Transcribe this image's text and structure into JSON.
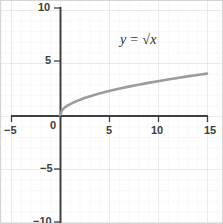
{
  "chart_data": {
    "type": "line",
    "title": "",
    "annotation": "y = √x",
    "function": "y = sqrt(x)",
    "xlabel": "",
    "ylabel": "",
    "xlim": [
      -5,
      15
    ],
    "ylim": [
      -10,
      10
    ],
    "x_ticks": [
      -5,
      0,
      5,
      10,
      15
    ],
    "x_tick_labels": [
      "−5",
      "0",
      "5",
      "10",
      "15"
    ],
    "y_ticks": [
      -10,
      -5,
      5,
      10
    ],
    "y_tick_labels": [
      "−10",
      "−5",
      "5",
      "10"
    ],
    "grid": true,
    "grid_minor_step": 1,
    "grid_major_step": 5,
    "legend": "none",
    "series": [
      {
        "name": "y = √x",
        "color": "#9c9c9c",
        "x": [
          0,
          0.25,
          0.5,
          0.75,
          1,
          1.5,
          2,
          2.5,
          3,
          3.5,
          4,
          5,
          6,
          7,
          8,
          9,
          10,
          11,
          12,
          13,
          14,
          15
        ],
        "y": [
          0,
          0.5,
          0.71,
          0.87,
          1,
          1.22,
          1.41,
          1.58,
          1.73,
          1.87,
          2,
          2.24,
          2.45,
          2.65,
          2.83,
          3,
          3.16,
          3.32,
          3.46,
          3.61,
          3.74,
          3.87
        ]
      }
    ]
  },
  "axes": {
    "x_labels": [
      {
        "text": "−5",
        "value": -5
      },
      {
        "text": "0",
        "value": 0
      },
      {
        "text": "5",
        "value": 5
      },
      {
        "text": "10",
        "value": 10
      },
      {
        "text": "15",
        "value": 15
      }
    ],
    "y_labels": [
      {
        "text": "10",
        "value": 10
      },
      {
        "text": "5",
        "value": 5
      },
      {
        "text": "−5",
        "value": -5
      },
      {
        "text": "−10",
        "value": -10
      }
    ]
  },
  "annotation": {
    "lhs": "y",
    "operator": "=",
    "radical": "√",
    "variable": "x"
  },
  "colors": {
    "curve": "#9c9c9c",
    "axis": "#404040",
    "grid_minor": "#eceaea",
    "grid_major": "#dedbdb",
    "text": "#3d3d3d",
    "frame": "#d4d4d4",
    "background": "#ffffff"
  }
}
